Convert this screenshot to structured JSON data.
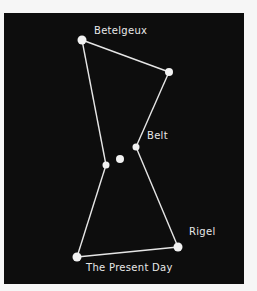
{
  "diagram": {
    "colors": {
      "background": "#0d0d0d",
      "page": "#f6f6f6",
      "lines": "#e6e6e6",
      "stars": "#f2f2f2",
      "text": "#e8e8e8"
    },
    "labels": {
      "betelgeux": "Betelgeux",
      "belt": "Belt",
      "rigel": "Rigel",
      "caption": "The Present Day"
    },
    "stars": [
      {
        "name": "Betelgeux",
        "x": 82,
        "y": 40,
        "r": 4.5
      },
      {
        "name": "Bellatrix",
        "x": 169,
        "y": 72,
        "r": 4
      },
      {
        "name": "Belt star 1",
        "x": 136,
        "y": 147,
        "r": 3.5
      },
      {
        "name": "Belt star 2",
        "x": 120,
        "y": 159,
        "r": 4
      },
      {
        "name": "Belt star 3",
        "x": 106,
        "y": 165,
        "r": 3.5
      },
      {
        "name": "Saiph",
        "x": 77,
        "y": 257,
        "r": 4.5
      },
      {
        "name": "Rigel",
        "x": 178,
        "y": 247,
        "r": 4.5
      }
    ]
  }
}
